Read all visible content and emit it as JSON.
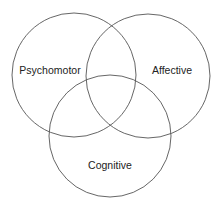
{
  "diagram": {
    "type": "venn",
    "sets": [
      {
        "id": "psychomotor",
        "label": "Psychomotor",
        "cx": 74,
        "cy": 75,
        "r": 62,
        "label_x": 50,
        "label_y": 74
      },
      {
        "id": "affective",
        "label": "Affective",
        "cx": 148,
        "cy": 76,
        "r": 62,
        "label_x": 172,
        "label_y": 74
      },
      {
        "id": "cognitive",
        "label": "Cognitive",
        "cx": 110,
        "cy": 136,
        "r": 61,
        "label_x": 110,
        "label_y": 169
      }
    ],
    "colors": {
      "stroke": "#555555",
      "text": "#222222",
      "background": "#ffffff"
    }
  }
}
